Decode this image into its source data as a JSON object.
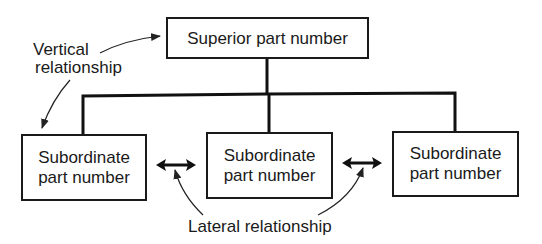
{
  "diagram": {
    "superior": {
      "label": "Superior part number"
    },
    "subordinates": [
      {
        "line1": "Subordinate",
        "line2": "part number"
      },
      {
        "line1": "Subordinate",
        "line2": "part number"
      },
      {
        "line1": "Subordinate",
        "line2": "part number"
      }
    ],
    "annotations": {
      "vertical_line1": "Vertical",
      "vertical_line2": "relationship",
      "lateral": "Lateral relationship"
    }
  }
}
